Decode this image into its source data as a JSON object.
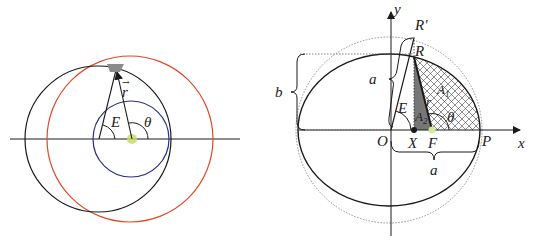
{
  "left_diagram": {
    "labels": {
      "r": "r",
      "E": "E",
      "theta": "θ"
    },
    "colors": {
      "orbit": "#1a1a1a",
      "red_circle": "#e04a2a",
      "blue_circle": "#2a2f8a",
      "focus": "#c8dc6a",
      "satellite": "#8a8a8a"
    }
  },
  "right_diagram": {
    "labels": {
      "y_axis": "y",
      "x_axis": "x",
      "R_prime": "R'",
      "R": "R",
      "a_vertical": "a",
      "b": "b",
      "E": "E",
      "A1": "A",
      "A1_sub": "1",
      "A2": "A",
      "A2_sub": "2",
      "r": "r",
      "theta": "θ",
      "O": "O",
      "X": "X",
      "F": "F",
      "P": "P",
      "a_horizontal": "a"
    }
  }
}
